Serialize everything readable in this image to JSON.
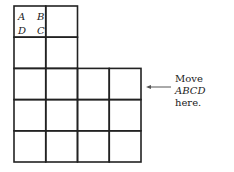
{
  "diagram": {
    "shape_labels": {
      "top_left": "A",
      "top_right": "B",
      "bottom_left": "D",
      "bottom_right": "C"
    },
    "grid": {
      "top_rows": 2,
      "top_cols": 2,
      "bottom_rows": 3,
      "bottom_cols": 4
    },
    "note": {
      "prefix": "Move",
      "shape": "ABCD",
      "line2": "here."
    },
    "arrow_icon": "left-arrow-icon"
  }
}
